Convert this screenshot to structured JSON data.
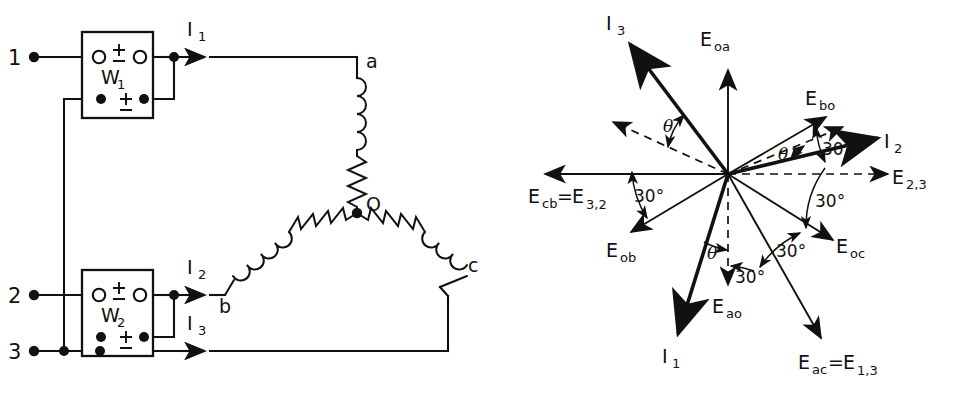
{
  "figure": {
    "stroke_color": "#111111",
    "background_color": "#ffffff"
  },
  "circuit": {
    "line_terminals": [
      {
        "name": "terminal-1",
        "label": "1"
      },
      {
        "name": "terminal-2",
        "label": "2"
      },
      {
        "name": "terminal-3",
        "label": "3"
      }
    ],
    "wattmeters": [
      {
        "name": "wattmeter-1",
        "label": "W",
        "subscript": "1",
        "polarity_top": "±",
        "polarity_bottom": "±"
      },
      {
        "name": "wattmeter-2",
        "label": "W",
        "subscript": "2",
        "polarity_top": "±",
        "polarity_bottom": "±"
      }
    ],
    "currents": [
      {
        "name": "current-I1",
        "label": "I",
        "subscript": "1"
      },
      {
        "name": "current-I2",
        "label": "I",
        "subscript": "2"
      },
      {
        "name": "current-I3",
        "label": "I",
        "subscript": "3"
      }
    ],
    "load_nodes": [
      {
        "name": "load-node-a",
        "label": "a"
      },
      {
        "name": "load-node-b",
        "label": "b"
      },
      {
        "name": "load-node-c",
        "label": "c"
      },
      {
        "name": "load-neutral-o",
        "label": "O"
      }
    ],
    "load_type": "wye (star) connected, each branch = inductor in series with resistor"
  },
  "phasor": {
    "vectors": [
      {
        "name": "phasor-Eoa",
        "label": "E",
        "subscript": "oa",
        "style": "solid-thin",
        "angle_deg": 90,
        "desc": "phase voltage O to a"
      },
      {
        "name": "phasor-Ebo",
        "label": "E",
        "subscript": "bo",
        "style": "solid-thin",
        "angle_deg": 30,
        "desc": "phase voltage b to O"
      },
      {
        "name": "phasor-Eoc",
        "label": "E",
        "subscript": "oc",
        "style": "solid-thin",
        "angle_deg": -30,
        "desc": "phase voltage O to c"
      },
      {
        "name": "phasor-Eao",
        "label": "E",
        "subscript": "ao",
        "style": "dashed",
        "angle_deg": -90,
        "desc": "phase voltage a to O"
      },
      {
        "name": "phasor-Eob",
        "label": "E",
        "subscript": "ob",
        "style": "solid-thin",
        "angle_deg": -150,
        "desc": "phase voltage O to b"
      },
      {
        "name": "phasor-I1",
        "label": "I",
        "subscript": "1",
        "style": "solid-bold",
        "angle_deg": -110,
        "desc": "line current 1"
      },
      {
        "name": "phasor-I2",
        "label": "I",
        "subscript": "2",
        "style": "solid-bold",
        "angle_deg": 13,
        "desc": "line current 2"
      },
      {
        "name": "phasor-I3",
        "label": "I",
        "subscript": "3",
        "style": "solid-bold",
        "angle_deg": 125,
        "desc": "line current 3"
      }
    ],
    "line_voltages": [
      {
        "name": "phasor-Ecb-E32",
        "label": "E",
        "subscript": "cb",
        "equals": "=",
        "label2": "E",
        "subscript2": "3,2",
        "style": "solid-thin",
        "angle_deg": 180,
        "text": "Eₑb=E₃,₂"
      },
      {
        "name": "phasor-E23",
        "label": "E",
        "subscript": "2,3",
        "style": "dashed",
        "angle_deg": 0,
        "text": "E₂,₃"
      },
      {
        "name": "phasor-Eac-E13",
        "label": "E",
        "subscript": "ac",
        "equals": "=",
        "label2": "E",
        "subscript2": "1,3",
        "style": "solid-thin",
        "angle_deg": -60,
        "text": "Eₐᴄ=E₁,₃"
      }
    ],
    "angle_labels": [
      {
        "name": "angle-theta-I3",
        "text": "θ",
        "between": "E3,2-reference and I3"
      },
      {
        "name": "angle-theta-I2",
        "text": "θ",
        "between": "E2,3-reference and I2"
      },
      {
        "name": "angle-theta-I1",
        "text": "θ",
        "between": "Eao and I1"
      },
      {
        "name": "angle-30-top-right",
        "text": "30°",
        "between": "I2 / E2,3 and Ebo"
      },
      {
        "name": "angle-30-right",
        "text": "30°",
        "between": "E2,3 and Eoc"
      },
      {
        "name": "angle-30-lower-right",
        "text": "30°",
        "between": "Eoc and Eac"
      },
      {
        "name": "angle-30-bottom",
        "text": "30°",
        "between": "Eao and Eac"
      },
      {
        "name": "angle-30-left",
        "text": "30°",
        "between": "Ecb and Eob"
      }
    ],
    "labels": {
      "Eoa": "E",
      "Eoa_sub": "oa",
      "Ebo": "E",
      "Ebo_sub": "bo",
      "Eoc": "E",
      "Eoc_sub": "oc",
      "Eao": "E",
      "Eao_sub": "ao",
      "Eob": "E",
      "Eob_sub": "ob",
      "I1": "I",
      "I1_sub": "1",
      "I2": "I",
      "I2_sub": "2",
      "I3": "I",
      "I3_sub": "3",
      "Ecb": "E",
      "Ecb_sub": "cb",
      "equals": "=",
      "E32": "E",
      "E32_sub": "3,2",
      "E23": "E",
      "E23_sub": "2,3",
      "Eac": "E",
      "Eac_sub": "ac",
      "E13": "E",
      "E13_sub": "1,3",
      "theta": "θ",
      "deg30": "30°"
    }
  }
}
